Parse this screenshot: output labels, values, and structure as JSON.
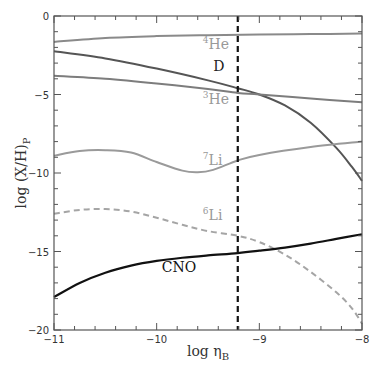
{
  "chart_data": {
    "type": "line",
    "title": "",
    "xlabel": "log η_B",
    "ylabel": "log (X/H)_P",
    "xlim": [
      -11,
      -8
    ],
    "ylim": [
      -20,
      0
    ],
    "grid": false,
    "legend": "inline labels",
    "x_ticks": [
      -11,
      -10,
      -9,
      -8
    ],
    "x_tick_labels": [
      "-11",
      "-10",
      "-9",
      "-8"
    ],
    "y_ticks": [
      0,
      -5,
      -10,
      -15,
      -20
    ],
    "y_tick_labels": [
      "0",
      "-5",
      "-10",
      "-15",
      "-20"
    ],
    "vertical_line": {
      "x": -9.21,
      "style": "dashed",
      "color": "#111111"
    },
    "series": [
      {
        "name": "4He",
        "label_sup": "4",
        "label_base": "He",
        "color": "#8a8a8a",
        "label_color": "#999999",
        "style": "solid",
        "width": 2,
        "label_pos": [
          -9.55,
          -2.1
        ],
        "x": [
          -11,
          -10.5,
          -10,
          -9.5,
          -9,
          -8.5,
          -8
        ],
        "y": [
          -1.65,
          -1.4,
          -1.28,
          -1.22,
          -1.18,
          -1.15,
          -1.12
        ]
      },
      {
        "name": "D",
        "label_sup": "",
        "label_base": "D",
        "color": "#555555",
        "label_color": "#222222",
        "style": "solid",
        "width": 2,
        "label_pos": [
          -9.45,
          -3.5
        ],
        "x": [
          -11,
          -10.5,
          -10,
          -9.5,
          -9.21,
          -9,
          -8.75,
          -8.5,
          -8.25,
          -8.1,
          -8
        ],
        "y": [
          -2.25,
          -2.7,
          -3.35,
          -4.1,
          -4.6,
          -5.0,
          -5.7,
          -6.8,
          -8.4,
          -9.6,
          -10.5
        ]
      },
      {
        "name": "3He",
        "label_sup": "3",
        "label_base": "He",
        "color": "#7d7d7d",
        "label_color": "#999999",
        "style": "solid",
        "width": 2,
        "label_pos": [
          -9.55,
          -5.6
        ],
        "x": [
          -11,
          -10.5,
          -10,
          -9.5,
          -9.21,
          -9,
          -8.5,
          -8
        ],
        "y": [
          -3.8,
          -4.0,
          -4.3,
          -4.65,
          -4.9,
          -5.0,
          -5.25,
          -5.5
        ]
      },
      {
        "name": "7Li",
        "label_sup": "7",
        "label_base": "Li",
        "color": "#9a9a9a",
        "label_color": "#999999",
        "style": "solid",
        "width": 2,
        "label_pos": [
          -9.55,
          -9.5
        ],
        "x": [
          -11,
          -10.75,
          -10.5,
          -10.25,
          -10,
          -9.75,
          -9.6,
          -9.45,
          -9.21,
          -9,
          -8.5,
          -8
        ],
        "y": [
          -8.9,
          -8.6,
          -8.55,
          -8.7,
          -9.3,
          -9.85,
          -9.95,
          -9.8,
          -9.2,
          -8.85,
          -8.35,
          -8.0
        ]
      },
      {
        "name": "6Li",
        "label_sup": "6",
        "label_base": "Li",
        "color": "#a5a5a5",
        "label_color": "#999999",
        "style": "dashed",
        "width": 2,
        "label_pos": [
          -9.55,
          -13.0
        ],
        "x": [
          -11,
          -10.75,
          -10.5,
          -10.25,
          -10,
          -9.75,
          -9.5,
          -9.21,
          -9,
          -8.75,
          -8.5,
          -8.25,
          -8.1,
          -8
        ],
        "y": [
          -12.6,
          -12.35,
          -12.3,
          -12.45,
          -12.85,
          -13.3,
          -13.7,
          -14.0,
          -14.4,
          -15.2,
          -16.3,
          -17.6,
          -18.6,
          -19.6
        ]
      },
      {
        "name": "CNO",
        "label_sup": "",
        "label_base": "CNO",
        "color": "#111111",
        "label_color": "#111111",
        "style": "solid",
        "width": 2.2,
        "label_pos": [
          -9.95,
          -16.3
        ],
        "x": [
          -11,
          -10.75,
          -10.5,
          -10.25,
          -10,
          -9.75,
          -9.5,
          -9.21,
          -9,
          -8.75,
          -8.5,
          -8.25,
          -8
        ],
        "y": [
          -17.9,
          -17.0,
          -16.35,
          -15.9,
          -15.6,
          -15.4,
          -15.25,
          -15.1,
          -14.95,
          -14.75,
          -14.5,
          -14.2,
          -13.9
        ]
      }
    ]
  }
}
